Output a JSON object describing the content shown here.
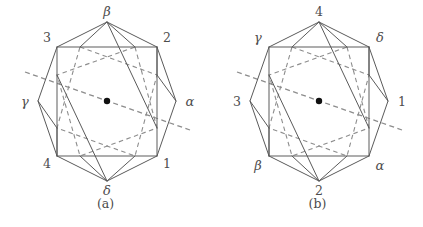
{
  "figure": {
    "type": "geometric-diagram",
    "panel_count": 2,
    "colors": {
      "solid_line": "#5a5a5a",
      "square_edge": "#6b6b6b",
      "dashed_line": "#8d8d8d",
      "center_dot": "#111111",
      "text": "#4d4d4d",
      "background": "#ffffff"
    }
  },
  "panels": [
    {
      "id": "a",
      "caption": "(a)",
      "square_corner_labels": {
        "top_left": "3",
        "top_right": "2",
        "bottom_right": "1",
        "bottom_left": "4"
      },
      "apex_labels": {
        "top": "β",
        "right": "α",
        "bottom": "δ",
        "left": "γ"
      },
      "labels": [
        {
          "name": "apex-top",
          "text": "β",
          "kind": "greek"
        },
        {
          "name": "corner-top-left",
          "text": "3",
          "kind": "numeral"
        },
        {
          "name": "corner-top-right",
          "text": "2",
          "kind": "numeral"
        },
        {
          "name": "apex-left",
          "text": "γ",
          "kind": "greek"
        },
        {
          "name": "apex-right",
          "text": "α",
          "kind": "greek"
        },
        {
          "name": "corner-bottom-left",
          "text": "4",
          "kind": "numeral"
        },
        {
          "name": "corner-bottom-right",
          "text": "1",
          "kind": "numeral"
        },
        {
          "name": "apex-bottom",
          "text": "δ",
          "kind": "greek"
        }
      ]
    },
    {
      "id": "b",
      "caption": "(b)",
      "square_corner_labels": {
        "top_left": "γ",
        "top_right": "δ",
        "bottom_right": "α",
        "bottom_left": "β"
      },
      "apex_labels": {
        "top": "4",
        "right": "1",
        "bottom": "2",
        "left": "3"
      },
      "labels": [
        {
          "name": "apex-top",
          "text": "4",
          "kind": "numeral"
        },
        {
          "name": "corner-top-left",
          "text": "γ",
          "kind": "greek"
        },
        {
          "name": "corner-top-right",
          "text": "δ",
          "kind": "greek"
        },
        {
          "name": "apex-left",
          "text": "3",
          "kind": "numeral"
        },
        {
          "name": "apex-right",
          "text": "1",
          "kind": "numeral"
        },
        {
          "name": "corner-bottom-left",
          "text": "β",
          "kind": "greek"
        },
        {
          "name": "corner-bottom-right",
          "text": "α",
          "kind": "greek"
        },
        {
          "name": "apex-bottom",
          "text": "2",
          "kind": "numeral"
        }
      ]
    }
  ],
  "geometry": {
    "square": {
      "left": 57,
      "top": 47,
      "right": 157,
      "bottom": 156
    },
    "apexes": {
      "top": [
        107,
        22
      ],
      "right": [
        176,
        101
      ],
      "bottom": [
        107,
        181
      ],
      "left": [
        38,
        101
      ]
    },
    "edge_nodes": {
      "top_left_of_top_edge": [
        80,
        47
      ],
      "top_right_of_top_edge": [
        135,
        47
      ],
      "right_top_of_right_edge": [
        157,
        75
      ],
      "right_bottom_of_right_edge": [
        157,
        128
      ],
      "bottom_right_of_bottom_edge": [
        135,
        156
      ],
      "bottom_left_of_bottom_edge": [
        80,
        156
      ],
      "left_bottom_of_left_edge": [
        57,
        128
      ],
      "left_top_of_left_edge": [
        57,
        75
      ]
    },
    "center_dot": [
      107,
      101
    ],
    "axis_line": {
      "from": [
        25,
        72
      ],
      "to": [
        190,
        130
      ]
    }
  }
}
